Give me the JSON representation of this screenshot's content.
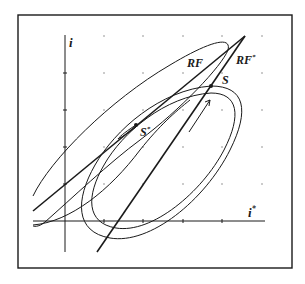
{
  "diagram": {
    "type": "phase-diagram",
    "axes": {
      "y_label": "i",
      "x_label": "i",
      "x_label_superscript": "*"
    },
    "curves": [
      {
        "id": "RF",
        "label": "RF"
      },
      {
        "id": "RF_star",
        "label": "RF",
        "label_superscript": "*"
      }
    ],
    "points": [
      {
        "id": "S",
        "label": "S"
      },
      {
        "id": "S_star",
        "label": "S",
        "label_superscript": "*"
      }
    ],
    "colors": {
      "ink": "#1a1a1a",
      "grid_dot": "#8a8a8a",
      "background": "#ffffff"
    }
  }
}
